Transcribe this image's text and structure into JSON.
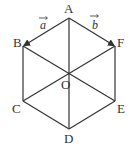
{
  "diagram": {
    "type": "regular-hexagon",
    "stroke_color": "#333333",
    "vertices": [
      {
        "name": "A",
        "x": 69,
        "y": 18
      },
      {
        "name": "B",
        "x": 23,
        "y": 46
      },
      {
        "name": "C",
        "x": 23,
        "y": 101
      },
      {
        "name": "D",
        "x": 69,
        "y": 129
      },
      {
        "name": "E",
        "x": 115,
        "y": 101
      },
      {
        "name": "F",
        "x": 115,
        "y": 46
      }
    ],
    "center": {
      "name": "O",
      "x": 69,
      "y": 73
    },
    "labels": {
      "A": "A",
      "B": "B",
      "C": "C",
      "D": "D",
      "E": "E",
      "F": "F",
      "O": "O"
    },
    "vectors": [
      {
        "name": "a",
        "label": "a",
        "from": "A",
        "to": "B"
      },
      {
        "name": "b",
        "label": "b",
        "from": "A",
        "to": "F"
      }
    ],
    "diagonals": [
      "A-D",
      "B-E",
      "F-C"
    ]
  }
}
